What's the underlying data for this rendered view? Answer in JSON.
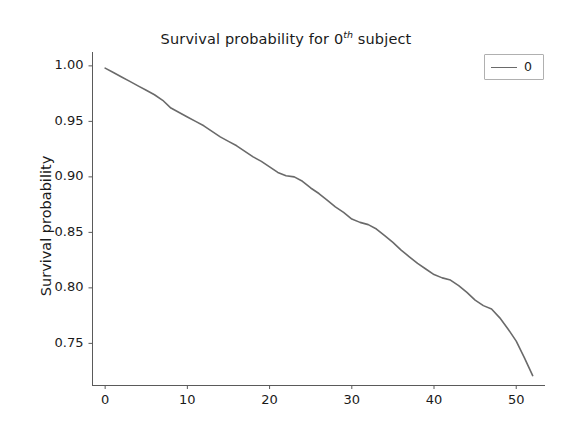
{
  "chart_data": {
    "type": "line",
    "title": "Survival probability for 0th subject",
    "title_main": "Survival probability for 0",
    "title_sup": "th",
    "title_tail": " subject",
    "xlabel": "",
    "ylabel": "Survival probability",
    "xlim": [
      -1.6,
      53.5
    ],
    "ylim": [
      0.7125,
      1.0125
    ],
    "grid": false,
    "legend_position": "upper right",
    "xticks": [
      0,
      10,
      20,
      30,
      40,
      50
    ],
    "xticklabels": [
      "0",
      "10",
      "20",
      "30",
      "40",
      "50"
    ],
    "yticks": [
      1.0,
      0.95,
      0.9,
      0.85,
      0.8,
      0.75
    ],
    "yticklabels": [
      "1.00",
      "0.95",
      "0.90",
      "0.85",
      "0.80",
      "0.75"
    ],
    "series": [
      {
        "name": "0",
        "color": "#6a6a6a",
        "linewidth": 1.6,
        "x": [
          0,
          1,
          2,
          3,
          4,
          5,
          6,
          7,
          8,
          9,
          10,
          11,
          12,
          13,
          14,
          15,
          16,
          17,
          18,
          19,
          20,
          21,
          22,
          23,
          24,
          25,
          26,
          27,
          28,
          29,
          30,
          31,
          32,
          33,
          34,
          35,
          36,
          37,
          38,
          39,
          40,
          41,
          42,
          43,
          44,
          45,
          46,
          47,
          48,
          49,
          50,
          51,
          52
        ],
        "values": [
          0.998,
          0.994,
          0.99,
          0.986,
          0.982,
          0.978,
          0.974,
          0.969,
          0.962,
          0.958,
          0.954,
          0.95,
          0.946,
          0.941,
          0.936,
          0.932,
          0.928,
          0.923,
          0.918,
          0.914,
          0.909,
          0.904,
          0.901,
          0.9,
          0.896,
          0.89,
          0.885,
          0.879,
          0.873,
          0.868,
          0.862,
          0.859,
          0.857,
          0.853,
          0.847,
          0.841,
          0.834,
          0.828,
          0.822,
          0.817,
          0.812,
          0.809,
          0.807,
          0.802,
          0.796,
          0.789,
          0.784,
          0.781,
          0.773,
          0.763,
          0.752,
          0.737,
          0.721
        ]
      }
    ],
    "legend_entries": [
      {
        "label": "0",
        "color": "#6a6a6a"
      }
    ],
    "axes_px": {
      "left": 92,
      "right": 545,
      "top": 52,
      "bottom": 385
    },
    "colors": {
      "line": "#6a6a6a",
      "text": "#1a1a1a",
      "spine": "#5a5a5a",
      "background": "#ffffff"
    }
  }
}
